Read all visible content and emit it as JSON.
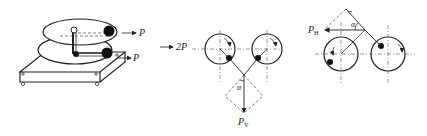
{
  "figure": {
    "panels": [
      {
        "id": "apparatus",
        "description": "Two counter-rotating eccentric masses on a base plate",
        "force_labels": [
          {
            "symbol": "P",
            "position": "upper"
          },
          {
            "symbol": "P",
            "position": "lower"
          }
        ],
        "resultant": {
          "label": "2P"
        }
      },
      {
        "id": "vertical-component",
        "angle_label": "α",
        "force_label": {
          "main": "P",
          "sub": "V"
        }
      },
      {
        "id": "horizontal-component",
        "angle_label": "α",
        "force_label": {
          "main": "P",
          "sub": "H"
        }
      }
    ]
  },
  "labels": {
    "p_upper": "P",
    "p_lower": "P",
    "two_p": "2P",
    "alpha_mid": "α",
    "pv_main": "P",
    "pv_sub": "V",
    "alpha_right": "α",
    "ph_main": "P",
    "ph_sub": "H"
  }
}
